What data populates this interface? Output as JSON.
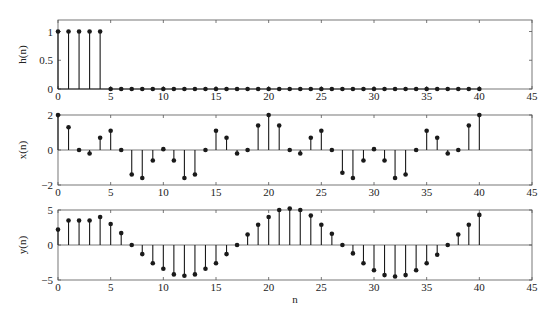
{
  "chart_data": [
    {
      "type": "stem",
      "title": "",
      "xlabel": "",
      "ylabel": "h(n)",
      "xlim": [
        0,
        45
      ],
      "ylim": [
        0,
        1.2
      ],
      "xticks": [
        0,
        5,
        10,
        15,
        20,
        25,
        30,
        35,
        40,
        45
      ],
      "yticks": [
        0,
        0.5,
        1
      ],
      "ytick_labels": [
        "0",
        "0.5",
        "1"
      ],
      "grid": false,
      "x": [
        0,
        1,
        2,
        3,
        4,
        5,
        6,
        7,
        8,
        9,
        10,
        11,
        12,
        13,
        14,
        15,
        16,
        17,
        18,
        19,
        20,
        21,
        22,
        23,
        24,
        25,
        26,
        27,
        28,
        29,
        30,
        31,
        32,
        33,
        34,
        35,
        36,
        37,
        38,
        39,
        40
      ],
      "values": [
        1,
        1,
        1,
        1,
        1,
        0,
        0,
        0,
        0,
        0,
        0,
        0,
        0,
        0,
        0,
        0,
        0,
        0,
        0,
        0,
        0,
        0,
        0,
        0,
        0,
        0,
        0,
        0,
        0,
        0,
        0,
        0,
        0,
        0,
        0,
        0,
        0,
        0,
        0,
        0,
        0
      ]
    },
    {
      "type": "stem",
      "title": "",
      "xlabel": "",
      "ylabel": "x(n)",
      "xlim": [
        0,
        45
      ],
      "ylim": [
        -2,
        2
      ],
      "xticks": [
        0,
        5,
        10,
        15,
        20,
        25,
        30,
        35,
        40,
        45
      ],
      "yticks": [
        -2,
        0,
        2
      ],
      "ytick_labels": [
        "−2",
        "0",
        "2"
      ],
      "grid": false,
      "x": [
        0,
        1,
        2,
        3,
        4,
        5,
        6,
        7,
        8,
        9,
        10,
        11,
        12,
        13,
        14,
        15,
        16,
        17,
        18,
        19,
        20,
        21,
        22,
        23,
        24,
        25,
        26,
        27,
        28,
        29,
        30,
        31,
        32,
        33,
        34,
        35,
        36,
        37,
        38,
        39,
        40
      ],
      "values": [
        2.0,
        1.3,
        0.0,
        -0.2,
        0.7,
        1.1,
        0.0,
        -1.4,
        -1.6,
        -0.6,
        0.05,
        -0.6,
        -1.6,
        -1.4,
        0.0,
        1.1,
        0.7,
        -0.2,
        0.0,
        1.4,
        2.0,
        1.4,
        0.0,
        -0.2,
        0.7,
        1.1,
        0.0,
        -1.3,
        -1.6,
        -0.6,
        0.05,
        -0.6,
        -1.6,
        -1.4,
        0.0,
        1.1,
        0.7,
        -0.2,
        0.0,
        1.4,
        2.0
      ]
    },
    {
      "type": "stem",
      "title": "",
      "xlabel": "n",
      "ylabel": "y(n)",
      "xlim": [
        0,
        45
      ],
      "ylim": [
        -5,
        5
      ],
      "xticks": [
        0,
        5,
        10,
        15,
        20,
        25,
        30,
        35,
        40,
        45
      ],
      "yticks": [
        -5,
        0,
        5
      ],
      "ytick_labels": [
        "−5",
        "0",
        "5"
      ],
      "grid": false,
      "x": [
        0,
        1,
        2,
        3,
        4,
        5,
        6,
        7,
        8,
        9,
        10,
        11,
        12,
        13,
        14,
        15,
        16,
        17,
        18,
        19,
        20,
        21,
        22,
        23,
        24,
        25,
        26,
        27,
        28,
        29,
        30,
        31,
        32,
        33,
        34,
        35,
        36,
        37,
        38,
        39,
        40
      ],
      "values": [
        2.2,
        3.5,
        3.5,
        3.5,
        4.0,
        3.0,
        1.7,
        0.0,
        -1.3,
        -2.6,
        -3.4,
        -4.2,
        -4.4,
        -4.2,
        -3.4,
        -2.6,
        -1.3,
        0.0,
        1.5,
        2.9,
        4.0,
        5.0,
        5.2,
        5.0,
        4.2,
        2.9,
        1.6,
        0.0,
        -1.2,
        -2.6,
        -3.6,
        -4.3,
        -4.5,
        -4.3,
        -3.6,
        -2.6,
        -1.4,
        0.0,
        1.5,
        2.9,
        4.3
      ]
    }
  ],
  "layout": {
    "plot_left": 58,
    "plot_right": 532,
    "panels": [
      {
        "top": 20,
        "bottom": 89
      },
      {
        "top": 115,
        "bottom": 185
      },
      {
        "top": 210,
        "bottom": 280
      }
    ],
    "stem_color": "#1a1a1a",
    "axis_color": "#555555"
  }
}
